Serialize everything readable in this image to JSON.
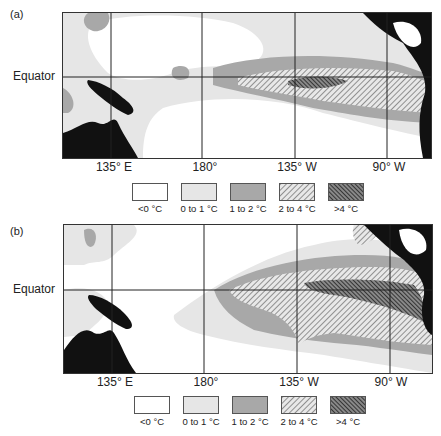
{
  "figure": {
    "panels": [
      {
        "label": "(a)",
        "equator_label": "Equator"
      },
      {
        "label": "(b)",
        "equator_label": "Equator"
      }
    ],
    "x_ticks": [
      "135° E",
      "180°",
      "135° W",
      "90° W"
    ],
    "legend": [
      {
        "label": "<0 °C",
        "fill": "#ffffff",
        "pattern": "none"
      },
      {
        "label": "0 to 1 °C",
        "fill": "#e6e6e6",
        "pattern": "none"
      },
      {
        "label": "1 to 2 °C",
        "fill": "#a8a8a8",
        "pattern": "none"
      },
      {
        "label": "2 to 4 °C",
        "fill": "#e0e0e0",
        "pattern": "light-hatch"
      },
      {
        "label": ">4 °C",
        "fill": "#707070",
        "pattern": "dark-hatch"
      }
    ],
    "colors": {
      "land": "#111111",
      "grid": "#222222"
    }
  }
}
